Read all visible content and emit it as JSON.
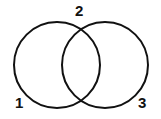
{
  "diagram": {
    "type": "venn-two-set",
    "background_color": "#ffffff",
    "stroke_color": "#111111",
    "stroke_width": 2,
    "circles": [
      {
        "name": "left-circle",
        "cx": 57,
        "cy": 65,
        "r": 43
      },
      {
        "name": "right-circle",
        "cx": 105,
        "cy": 65,
        "r": 43
      }
    ],
    "intersection_points": [
      {
        "name": "top-intersection",
        "x": 81,
        "y": 21
      },
      {
        "name": "bottom-intersection",
        "x": 81,
        "y": 109
      }
    ],
    "labels": [
      {
        "id": "1",
        "text": "1",
        "region": "left-only",
        "x": 15,
        "y": 95
      },
      {
        "id": "2",
        "text": "2",
        "region": "intersection",
        "x": 75,
        "y": 3
      },
      {
        "id": "3",
        "text": "3",
        "region": "right-only",
        "x": 138,
        "y": 95
      }
    ]
  }
}
